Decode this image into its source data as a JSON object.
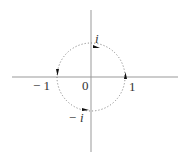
{
  "diagram": {
    "labels": {
      "origin": "0",
      "pos_real": "1",
      "neg_real": "− 1",
      "pos_imag": "i",
      "neg_imag": "− i"
    },
    "circle": {
      "style": "dotted",
      "direction": "counterclockwise",
      "radius": 1
    },
    "arrows": [
      "right-up",
      "top-left",
      "left-down",
      "bottom-right"
    ],
    "colors": {
      "axis": "#999999",
      "circle": "#777777",
      "text": "#333333",
      "arrow": "#111111"
    }
  }
}
